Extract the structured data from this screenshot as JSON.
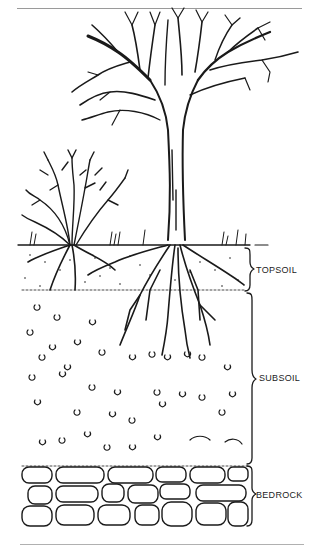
{
  "figure": {
    "layers": [
      {
        "id": "topsoil",
        "label": "TOPSOIL"
      },
      {
        "id": "subsoil",
        "label": "SUBSOIL"
      },
      {
        "id": "bedrock",
        "label": "BEDROCK"
      }
    ],
    "ink_color": "#1a1a1a",
    "rule_color": "#9a9a9a"
  }
}
